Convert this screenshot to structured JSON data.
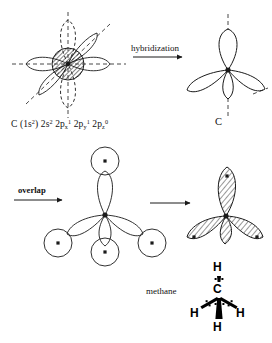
{
  "figure": {
    "background_color": "#ffffff",
    "stroke_color": "#1a1a1a"
  },
  "labels": {
    "hybridization_arrow": "hybridization",
    "overlap_arrow": "overlap",
    "plain_arrow": "",
    "methane": "methane",
    "carbon_atom": "C"
  },
  "electron_configuration": {
    "element": "C",
    "core": "(1s",
    "core_sup": "2",
    "core_close": ")",
    "orbitals": [
      {
        "shell": "2s",
        "sub": "",
        "sup": "2"
      },
      {
        "shell": "2p",
        "sub": "x",
        "sup": "1"
      },
      {
        "shell": "2p",
        "sub": "y",
        "sup": "1"
      },
      {
        "shell": "2p",
        "sub": "z",
        "sup": "0"
      }
    ],
    "full_text": "C (1s2) 2s2 2px1 2py1 2pz0"
  },
  "structure_formula": {
    "center": "C",
    "hydrogens": [
      "H",
      "H",
      "H",
      "H"
    ],
    "h_top": "H",
    "h_left": "H",
    "h_right": "H",
    "h_bottom": "H"
  },
  "panels": {
    "ground_state": {
      "name": "ground-state carbon orbitals",
      "lobe_count": 6,
      "has_hatched_core": true,
      "axis_style": "dashed"
    },
    "hybrid": {
      "name": "sp3 hybrid orbitals",
      "lobe_count": 4,
      "axis_style": "dashed"
    },
    "overlap": {
      "name": "sp3 orbitals overlapping hydrogen 1s orbitals",
      "lobe_count": 4,
      "hydrogen_circles": 4
    },
    "bonded": {
      "name": "methane bonding molecular orbitals",
      "lobe_count": 4,
      "shading": "hatched"
    }
  }
}
